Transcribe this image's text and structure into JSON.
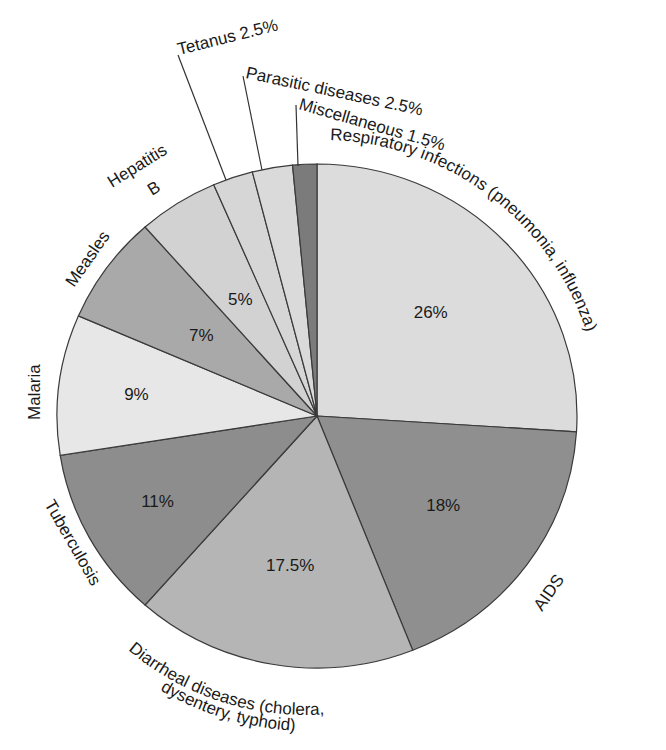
{
  "chart_data": {
    "type": "pie",
    "title": "",
    "start_angle_deg": 0,
    "direction": "clockwise",
    "slices": [
      {
        "label": "Respiratory infections (pneumonia, influenza)",
        "value": 26,
        "pct_label": "26%",
        "color": "#dcdcdc"
      },
      {
        "label": "AIDS",
        "value": 18,
        "pct_label": "18%",
        "color": "#8f8f8f"
      },
      {
        "label": "Diarrheal diseases (cholera, dysentery, typhoid)",
        "value": 17.5,
        "pct_label": "17.5%",
        "color": "#b5b5b5"
      },
      {
        "label": "Tuberculosis",
        "value": 11,
        "pct_label": "11%",
        "color": "#8d8d8d"
      },
      {
        "label": "Malaria",
        "value": 9,
        "pct_label": "9%",
        "color": "#e7e7e7"
      },
      {
        "label": "Measles",
        "value": 7,
        "pct_label": "7%",
        "color": "#a9a9a9"
      },
      {
        "label": "Hepatitis B",
        "value": 5,
        "pct_label": "5%",
        "color": "#d2d2d2"
      },
      {
        "label": "Tetanus",
        "value": 2.5,
        "pct_label": "2.5%",
        "color": "#d6d6d6"
      },
      {
        "label": "Parasitic diseases",
        "value": 2.5,
        "pct_label": "2.5%",
        "color": "#dadada"
      },
      {
        "label": "Miscellaneous",
        "value": 1.5,
        "pct_label": "1.5%",
        "color": "#7b7b7b"
      }
    ]
  },
  "labels": {
    "respiratory": "Respiratory infections (pneumonia, influenza)",
    "aids": "AIDS",
    "diarrheal_line1": "Diarrheal diseases (cholera,",
    "diarrheal_line2": "dysentery, typhoid)",
    "tuberculosis": "Tuberculosis",
    "malaria": "Malaria",
    "measles": "Measles",
    "hepatitis_line1": "Hepatitis",
    "hepatitis_line2": "B",
    "tetanus": "Tetanus 2.5%",
    "parasitic": "Parasitic diseases 2.5%",
    "miscellaneous": "Miscellaneous 1.5%"
  }
}
